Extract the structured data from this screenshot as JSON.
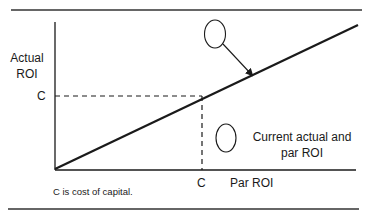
{
  "diagram": {
    "y_axis_label_line1": "Actual",
    "y_axis_label_line2": "ROI",
    "x_axis_label": "Par ROI",
    "y_tick": "C",
    "x_tick": "C",
    "legend_note_line1": "Current actual and",
    "legend_note_line2": "par ROI",
    "caption": "C is cost of capital.",
    "line_color": "#1a1a1a",
    "elements": {
      "diagonal_line": "Actual ROI equals Par ROI line",
      "dashed_guides": "Cost of capital reference lines",
      "top_circle": "empty marker with arrow pointing to diagonal line",
      "bottom_circle": "empty marker labeled current actual and par ROI"
    }
  }
}
